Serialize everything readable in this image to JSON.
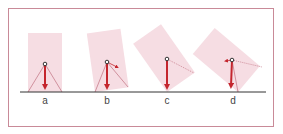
{
  "figures": [
    {
      "label": "a",
      "tilt_deg": 0
    },
    {
      "label": "b",
      "tilt_deg": -8
    },
    {
      "label": "c",
      "tilt_deg": -35
    },
    {
      "label": "d",
      "tilt_deg": -50
    }
  ],
  "colors": {
    "frame": "#c98a98",
    "block_fill": "#f6dde3",
    "arrow": "#c4262e",
    "dot": "#333333",
    "ground": "#333333",
    "dotted": "#c07080"
  }
}
